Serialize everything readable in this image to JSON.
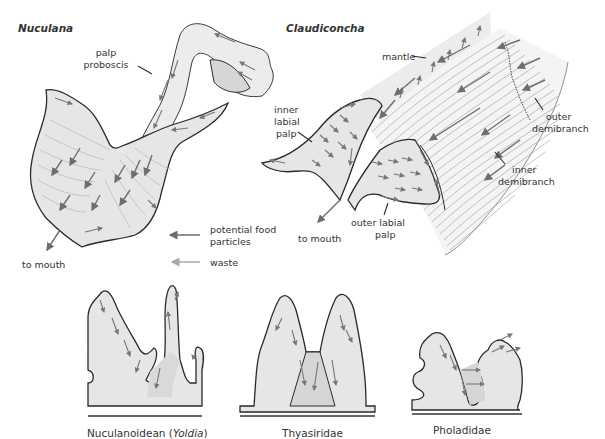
{
  "figure": {
    "panels": {
      "nuculana": {
        "title": "Nuculana",
        "labels": {
          "palp_proboscis_line1": "palp",
          "palp_proboscis_line2": "proboscis",
          "to_mouth": "to mouth"
        }
      },
      "claudiconcha": {
        "title": "Claudiconcha",
        "labels": {
          "mantle": "mantle",
          "inner_labial_palp_line1": "inner",
          "inner_labial_palp_line2": "labial",
          "inner_labial_palp_line3": "palp",
          "outer_demibranch_line1": "outer",
          "outer_demibranch_line2": "demibranch",
          "inner_demibranch_line1": "inner",
          "inner_demibranch_line2": "demibranch",
          "outer_labial_palp_line1": "outer labial",
          "outer_labial_palp_line2": "palp",
          "to_mouth": "to mouth"
        }
      }
    },
    "legend": {
      "items": [
        {
          "label_line1": "potential food",
          "label_line2": "particles",
          "color": "#6e6e6e"
        },
        {
          "label_line1": "waste",
          "label_line2": "",
          "color": "#a8a8a8"
        }
      ]
    },
    "cross_sections": [
      {
        "caption_main": "Nuculanoidean (",
        "caption_italic": "Yoldia",
        "caption_end": ")"
      },
      {
        "caption_main": "Thyasiridae"
      },
      {
        "caption_main": "Pholadidae"
      }
    ],
    "colors": {
      "outline": "#2a2a2a",
      "fill": "#e6e6e6",
      "arrow_food": "#6e6e6e",
      "arrow_waste": "#a8a8a8",
      "text": "#333333"
    }
  }
}
